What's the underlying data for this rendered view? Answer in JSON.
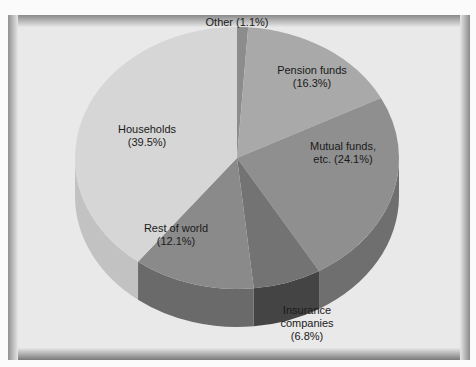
{
  "chart_data": {
    "type": "pie",
    "title": "",
    "style": "3d-pie",
    "categories": [
      "Other",
      "Pension funds",
      "Mutual funds, etc.",
      "Insurance companies",
      "Rest of world",
      "Households"
    ],
    "values": [
      1.1,
      16.3,
      24.1,
      6.8,
      12.1,
      39.5
    ],
    "unit": "%",
    "start_angle": "12 o'clock, clockwise",
    "slices": [
      {
        "name": "Other",
        "value": 1.1,
        "label_line1": "Other (1.1%)",
        "label_line2": "",
        "label_line3": "",
        "top_color": "#8c8c8c",
        "side_color": "#6e6e6e"
      },
      {
        "name": "Pension funds",
        "value": 16.3,
        "label_line1": "Pension funds",
        "label_line2": "(16.3%)",
        "label_line3": "",
        "top_color": "#a9a9a9",
        "side_color": "#8a8a8a"
      },
      {
        "name": "Mutual funds, etc.",
        "value": 24.1,
        "label_line1": "Mutual funds,",
        "label_line2": "etc. (24.1%)",
        "label_line3": "",
        "top_color": "#8f8f8f",
        "side_color": "#6f6f6f"
      },
      {
        "name": "Insurance companies",
        "value": 6.8,
        "label_line1": "Insurance",
        "label_line2": "companies",
        "label_line3": "(6.8%)",
        "top_color": "#737373",
        "side_color": "#444444"
      },
      {
        "name": "Rest of world",
        "value": 12.1,
        "label_line1": "Rest of world",
        "label_line2": "(12.1%)",
        "label_line3": "",
        "top_color": "#8a8a8a",
        "side_color": "#6a6a6a"
      },
      {
        "name": "Households",
        "value": 39.5,
        "label_line1": "Households",
        "label_line2": "(39.5%)",
        "label_line3": "",
        "top_color": "#d6d6d6",
        "side_color": "#c2c2c2"
      }
    ]
  }
}
